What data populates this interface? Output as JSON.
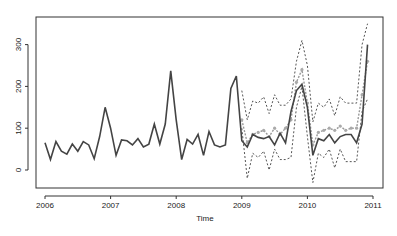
{
  "chart_data": {
    "type": "line",
    "title": "",
    "xlabel": "Time",
    "ylabel": "",
    "xlim": [
      2006,
      2011
    ],
    "ylim": [
      -40,
      370
    ],
    "x_ticks": [
      "2006",
      "2007",
      "2008",
      "2009",
      "2010",
      "2011"
    ],
    "y_ticks": [
      "0",
      "100",
      "200",
      "300"
    ],
    "grid": false,
    "legend": null,
    "series": [
      {
        "name": "observed",
        "style": "solid-dark",
        "start": 2006.0,
        "freq": 12,
        "values": [
          65,
          25,
          68,
          45,
          38,
          62,
          45,
          68,
          60,
          27,
          80,
          150,
          100,
          35,
          72,
          70,
          60,
          75,
          55,
          62,
          110,
          62,
          110,
          237,
          120,
          25,
          73,
          62,
          85,
          35,
          92,
          60,
          55,
          60,
          195,
          225,
          70,
          55,
          85,
          78,
          75,
          80,
          60,
          88,
          65,
          140,
          190,
          205,
          150,
          35,
          75,
          70,
          85,
          65,
          80,
          85,
          85,
          65,
          110,
          300
        ]
      },
      {
        "name": "fitted-forecast",
        "style": "dashed-grey-points",
        "start": 2009.0,
        "freq": 12,
        "values": [
          120,
          65,
          85,
          90,
          95,
          80,
          100,
          85,
          100,
          120,
          210,
          240,
          160,
          60,
          90,
          95,
          100,
          95,
          105,
          95,
          100,
          100,
          180,
          260
        ]
      },
      {
        "name": "upper-bound",
        "style": "dashed-dark",
        "start": 2009.0,
        "freq": 12,
        "values": [
          190,
          120,
          165,
          160,
          175,
          135,
          180,
          155,
          155,
          170,
          260,
          310,
          250,
          115,
          160,
          150,
          170,
          130,
          175,
          160,
          160,
          160,
          300,
          350
        ]
      },
      {
        "name": "lower-bound",
        "style": "dashed-dark",
        "start": 2009.0,
        "freq": 12,
        "values": [
          100,
          -20,
          40,
          30,
          45,
          0,
          50,
          25,
          25,
          30,
          150,
          200,
          80,
          -30,
          40,
          30,
          50,
          5,
          50,
          20,
          20,
          20,
          140,
          170
        ]
      }
    ]
  }
}
